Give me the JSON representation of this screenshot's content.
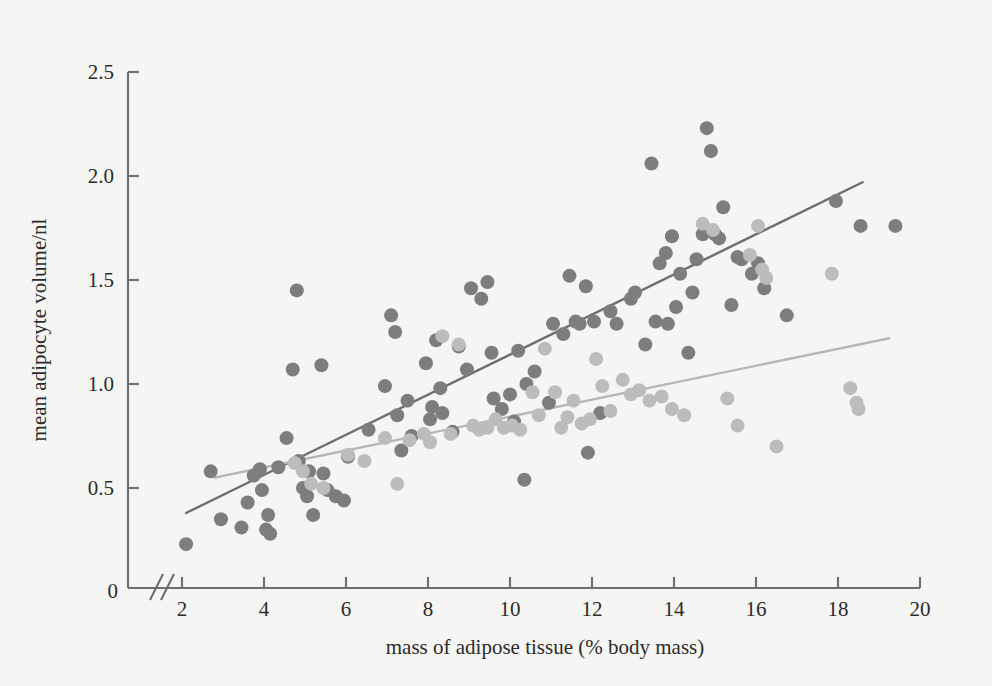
{
  "chart_data": {
    "type": "scatter",
    "title": "",
    "xlabel": "mass of adipose tissue (% body mass)",
    "ylabel": "mean adipocyte volume/nl",
    "xlim": [
      1.6,
      20.2
    ],
    "ylim": [
      0.0,
      2.5
    ],
    "xticks": [
      2,
      4,
      6,
      8,
      10,
      12,
      14,
      16,
      18,
      20
    ],
    "xtick_labels": [
      "2",
      "4",
      "6",
      "8",
      "10",
      "12",
      "14",
      "16",
      "18",
      "20"
    ],
    "yticks": [
      0.5,
      1.0,
      1.5,
      2.0,
      2.5
    ],
    "ytick_labels": [
      "0.5",
      "1.0",
      "1.5",
      "2.0",
      "2.5"
    ],
    "origin_label": "0",
    "axis_break": true,
    "grid": false,
    "legend": "none",
    "point_radius_px": 7,
    "colors": {
      "series_dark": "#7d7d7d",
      "series_light": "#bcbcbc",
      "line_dark": "#6e6e70",
      "line_light": "#b6b6b6",
      "axis": "#6e6e70",
      "background": "#f5f5f3",
      "text": "#2b2b2b"
    },
    "series": [
      {
        "name": "series-dark",
        "color": "#7d7d7d",
        "points": [
          [
            2.1,
            0.23
          ],
          [
            2.7,
            0.58
          ],
          [
            2.95,
            0.35
          ],
          [
            3.45,
            0.31
          ],
          [
            3.6,
            0.43
          ],
          [
            3.75,
            0.56
          ],
          [
            3.9,
            0.59
          ],
          [
            3.95,
            0.49
          ],
          [
            4.05,
            0.3
          ],
          [
            4.1,
            0.37
          ],
          [
            4.15,
            0.28
          ],
          [
            4.35,
            0.6
          ],
          [
            4.55,
            0.74
          ],
          [
            4.7,
            1.07
          ],
          [
            4.8,
            1.45
          ],
          [
            4.85,
            0.63
          ],
          [
            4.95,
            0.5
          ],
          [
            5.05,
            0.46
          ],
          [
            5.1,
            0.58
          ],
          [
            5.2,
            0.37
          ],
          [
            5.4,
            1.09
          ],
          [
            5.45,
            0.57
          ],
          [
            5.55,
            0.49
          ],
          [
            5.75,
            0.46
          ],
          [
            5.95,
            0.44
          ],
          [
            6.05,
            0.65
          ],
          [
            6.55,
            0.78
          ],
          [
            6.95,
            0.99
          ],
          [
            7.1,
            1.33
          ],
          [
            7.2,
            1.25
          ],
          [
            7.25,
            0.85
          ],
          [
            7.35,
            0.68
          ],
          [
            7.5,
            0.92
          ],
          [
            7.6,
            0.75
          ],
          [
            7.95,
            1.1
          ],
          [
            8.05,
            0.83
          ],
          [
            8.1,
            0.89
          ],
          [
            8.2,
            1.21
          ],
          [
            8.3,
            0.98
          ],
          [
            8.35,
            0.86
          ],
          [
            8.6,
            0.77
          ],
          [
            8.75,
            1.18
          ],
          [
            8.95,
            1.07
          ],
          [
            9.05,
            1.46
          ],
          [
            9.3,
            1.41
          ],
          [
            9.45,
            1.49
          ],
          [
            9.55,
            1.15
          ],
          [
            9.6,
            0.93
          ],
          [
            9.8,
            0.88
          ],
          [
            10.0,
            0.95
          ],
          [
            10.1,
            0.82
          ],
          [
            10.2,
            1.16
          ],
          [
            10.35,
            0.54
          ],
          [
            10.4,
            1.0
          ],
          [
            10.6,
            1.06
          ],
          [
            10.95,
            0.91
          ],
          [
            11.05,
            1.29
          ],
          [
            11.3,
            1.24
          ],
          [
            11.45,
            1.52
          ],
          [
            11.6,
            1.3
          ],
          [
            11.7,
            1.29
          ],
          [
            11.85,
            1.47
          ],
          [
            11.9,
            0.67
          ],
          [
            12.05,
            1.3
          ],
          [
            12.2,
            0.86
          ],
          [
            12.45,
            1.35
          ],
          [
            12.6,
            1.29
          ],
          [
            12.95,
            1.41
          ],
          [
            13.05,
            1.44
          ],
          [
            13.3,
            1.19
          ],
          [
            13.45,
            2.06
          ],
          [
            13.55,
            1.3
          ],
          [
            13.65,
            1.58
          ],
          [
            13.8,
            1.63
          ],
          [
            13.85,
            1.29
          ],
          [
            13.95,
            1.71
          ],
          [
            14.05,
            1.37
          ],
          [
            14.15,
            1.53
          ],
          [
            14.35,
            1.15
          ],
          [
            14.45,
            1.44
          ],
          [
            14.55,
            1.6
          ],
          [
            14.7,
            1.72
          ],
          [
            14.8,
            2.23
          ],
          [
            14.9,
            2.12
          ],
          [
            15.0,
            1.72
          ],
          [
            15.1,
            1.7
          ],
          [
            15.2,
            1.85
          ],
          [
            15.4,
            1.38
          ],
          [
            15.55,
            1.61
          ],
          [
            15.65,
            1.6
          ],
          [
            15.9,
            1.53
          ],
          [
            16.05,
            1.58
          ],
          [
            16.2,
            1.46
          ],
          [
            16.75,
            1.33
          ],
          [
            17.95,
            1.88
          ],
          [
            18.55,
            1.76
          ],
          [
            19.4,
            1.76
          ]
        ]
      },
      {
        "name": "series-light",
        "color": "#bcbcbc",
        "points": [
          [
            4.75,
            0.62
          ],
          [
            4.95,
            0.58
          ],
          [
            5.15,
            0.52
          ],
          [
            5.45,
            0.5
          ],
          [
            6.05,
            0.66
          ],
          [
            6.45,
            0.63
          ],
          [
            6.95,
            0.74
          ],
          [
            7.25,
            0.52
          ],
          [
            7.55,
            0.73
          ],
          [
            7.9,
            0.76
          ],
          [
            8.05,
            0.72
          ],
          [
            8.35,
            1.23
          ],
          [
            8.55,
            0.76
          ],
          [
            8.75,
            1.19
          ],
          [
            9.1,
            0.8
          ],
          [
            9.25,
            0.78
          ],
          [
            9.45,
            0.79
          ],
          [
            9.65,
            0.83
          ],
          [
            9.85,
            0.79
          ],
          [
            10.05,
            0.8
          ],
          [
            10.25,
            0.78
          ],
          [
            10.55,
            0.96
          ],
          [
            10.7,
            0.85
          ],
          [
            10.85,
            1.17
          ],
          [
            11.1,
            0.96
          ],
          [
            11.25,
            0.79
          ],
          [
            11.4,
            0.84
          ],
          [
            11.55,
            0.92
          ],
          [
            11.75,
            0.81
          ],
          [
            11.95,
            0.83
          ],
          [
            12.1,
            1.12
          ],
          [
            12.25,
            0.99
          ],
          [
            12.45,
            0.87
          ],
          [
            12.75,
            1.02
          ],
          [
            12.95,
            0.95
          ],
          [
            13.15,
            0.97
          ],
          [
            13.4,
            0.92
          ],
          [
            13.7,
            0.94
          ],
          [
            13.95,
            0.88
          ],
          [
            14.25,
            0.85
          ],
          [
            14.7,
            1.77
          ],
          [
            14.95,
            1.74
          ],
          [
            15.3,
            0.93
          ],
          [
            15.55,
            0.8
          ],
          [
            15.85,
            1.62
          ],
          [
            16.05,
            1.76
          ],
          [
            16.15,
            1.55
          ],
          [
            16.25,
            1.51
          ],
          [
            16.5,
            0.7
          ],
          [
            17.85,
            1.53
          ],
          [
            18.3,
            0.98
          ],
          [
            18.45,
            0.91
          ],
          [
            18.5,
            0.88
          ]
        ]
      }
    ],
    "fit_lines": [
      {
        "name": "fit-dark",
        "color": "#6e6e70",
        "x_start": 2.1,
        "y_start": 0.38,
        "x_end": 18.6,
        "y_end": 1.97
      },
      {
        "name": "fit-light",
        "color": "#b6b6b6",
        "x_start": 2.8,
        "y_start": 0.55,
        "x_end": 19.25,
        "y_end": 1.22
      }
    ]
  }
}
